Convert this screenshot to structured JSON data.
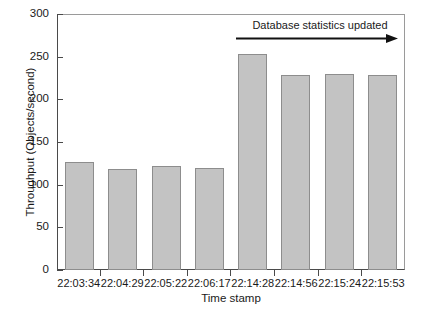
{
  "chart_data": {
    "type": "bar",
    "title": "",
    "xlabel": "Time stamp",
    "ylabel": "Throughput (Objects/second)",
    "categories": [
      "22:03:34",
      "22:04:29",
      "22:05:22",
      "22:06:17",
      "22:14:28",
      "22:14:56",
      "22:15:24",
      "22:15:53"
    ],
    "values": [
      127,
      119,
      122,
      120,
      254,
      230,
      231,
      230
    ],
    "ylim": [
      0,
      300
    ],
    "yticks": [
      0,
      50,
      100,
      150,
      200,
      250,
      300
    ],
    "ytick_labels": [
      "0",
      "50",
      "100",
      "150",
      "200",
      "250",
      "300"
    ],
    "grid": false,
    "legend": null,
    "annotations": [
      {
        "text": "Database statistics updated",
        "arrow": "right-arrow",
        "spans_categories": [
          "22:14:28",
          "22:15:53"
        ]
      }
    ],
    "colors": {
      "bar_fill": "#c3c3c3",
      "bar_edge": "#8d8d8d",
      "axis": "#4a4a4a",
      "text": "#1a1a1a",
      "background": "#ffffff"
    }
  }
}
